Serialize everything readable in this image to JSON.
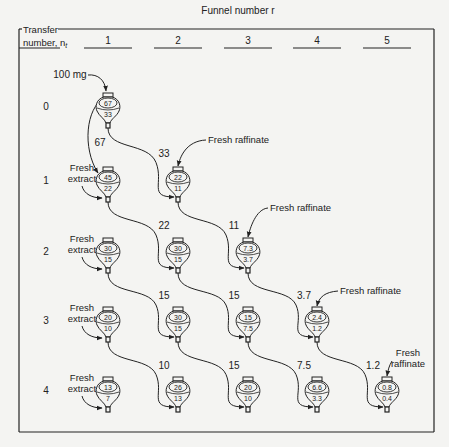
{
  "header": {
    "title": "Funnel number r",
    "row_axis_label_line1": "Transfer",
    "row_axis_label_line2": "number, n",
    "row_axis_subscript": "t",
    "columns": [
      "1",
      "2",
      "3",
      "4",
      "5"
    ]
  },
  "rows": [
    {
      "label": "0"
    },
    {
      "label": "1"
    },
    {
      "label": "2"
    },
    {
      "label": "3"
    },
    {
      "label": "4"
    }
  ],
  "initial_load": "100 mg",
  "fresh_extract_label": [
    "Fresh",
    "extract"
  ],
  "fresh_raffinate_label": "Fresh raffinate",
  "fresh_raffinate_label_split": [
    "Fresh",
    "raffinate"
  ],
  "funnels": [
    {
      "row": 0,
      "col": 1,
      "upper": "67",
      "lower": "33"
    },
    {
      "row": 1,
      "col": 1,
      "upper": "45",
      "lower": "22"
    },
    {
      "row": 1,
      "col": 2,
      "upper": "22",
      "lower": "11"
    },
    {
      "row": 2,
      "col": 1,
      "upper": "30",
      "lower": "15"
    },
    {
      "row": 2,
      "col": 2,
      "upper": "30",
      "lower": "15"
    },
    {
      "row": 2,
      "col": 3,
      "upper": "7.3",
      "lower": "3.7"
    },
    {
      "row": 3,
      "col": 1,
      "upper": "20",
      "lower": "10"
    },
    {
      "row": 3,
      "col": 2,
      "upper": "30",
      "lower": "15"
    },
    {
      "row": 3,
      "col": 3,
      "upper": "15",
      "lower": "7.5"
    },
    {
      "row": 3,
      "col": 4,
      "upper": "2.4",
      "lower": "1.2"
    },
    {
      "row": 4,
      "col": 1,
      "upper": "13",
      "lower": "7"
    },
    {
      "row": 4,
      "col": 2,
      "upper": "26",
      "lower": "13"
    },
    {
      "row": 4,
      "col": 3,
      "upper": "20",
      "lower": "10"
    },
    {
      "row": 4,
      "col": 4,
      "upper": "6.6",
      "lower": "3.3"
    },
    {
      "row": 4,
      "col": 5,
      "upper": "0.8",
      "lower": "0.4"
    }
  ],
  "transfers": [
    {
      "from_row": 0,
      "from_col": 1,
      "to_col": 1,
      "amount": "67",
      "kind": "upper-stays"
    },
    {
      "from_row": 0,
      "from_col": 1,
      "to_col": 2,
      "amount": "33"
    },
    {
      "from_row": 1,
      "from_col": 1,
      "to_col": 2,
      "amount": "22"
    },
    {
      "from_row": 1,
      "from_col": 2,
      "to_col": 3,
      "amount": "11"
    },
    {
      "from_row": 2,
      "from_col": 1,
      "to_col": 2,
      "amount": "15"
    },
    {
      "from_row": 2,
      "from_col": 2,
      "to_col": 3,
      "amount": "15"
    },
    {
      "from_row": 2,
      "from_col": 3,
      "to_col": 4,
      "amount": "3.7"
    },
    {
      "from_row": 3,
      "from_col": 1,
      "to_col": 2,
      "amount": "10"
    },
    {
      "from_row": 3,
      "from_col": 2,
      "to_col": 3,
      "amount": "15"
    },
    {
      "from_row": 3,
      "from_col": 3,
      "to_col": 4,
      "amount": "7.5"
    },
    {
      "from_row": 3,
      "from_col": 4,
      "to_col": 5,
      "amount": "1.2"
    }
  ],
  "colors": {
    "ink": "#222222",
    "background": "#f4f4f2"
  }
}
